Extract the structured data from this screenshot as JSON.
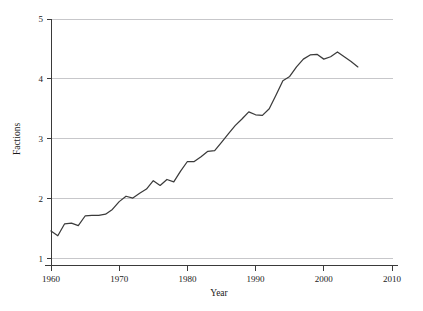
{
  "chart_data": {
    "type": "line",
    "title": "",
    "xlabel": "Year",
    "ylabel": "Factions",
    "xlim": [
      1960,
      2010
    ],
    "ylim": [
      1,
      5
    ],
    "grid": true,
    "legend": null,
    "xticks": [
      1960,
      1970,
      1980,
      1990,
      2000,
      2010
    ],
    "yticks": [
      1,
      2,
      3,
      4,
      5
    ],
    "xtick_labels": [
      "1960",
      "1970",
      "1980",
      "1990",
      "2000",
      "2010"
    ],
    "ytick_labels": [
      "1",
      "2",
      "3",
      "4",
      "5"
    ],
    "line_color": "#3b3b3b",
    "grid_color": "#b9b9bd",
    "series": [
      {
        "name": "Factions",
        "x": [
          1960,
          1961,
          1962,
          1963,
          1964,
          1965,
          1966,
          1967,
          1968,
          1969,
          1970,
          1971,
          1972,
          1973,
          1974,
          1975,
          1976,
          1977,
          1978,
          1979,
          1980,
          1981,
          1982,
          1983,
          1984,
          1985,
          1986,
          1987,
          1988,
          1989,
          1990,
          1991,
          1992,
          1993,
          1994,
          1995,
          1996,
          1997,
          1998,
          1999,
          2000,
          2001,
          2002,
          2003,
          2004,
          2005
        ],
        "values": [
          1.46,
          1.38,
          1.58,
          1.59,
          1.55,
          1.71,
          1.72,
          1.72,
          1.74,
          1.82,
          1.95,
          2.04,
          2.01,
          2.09,
          2.16,
          2.3,
          2.22,
          2.32,
          2.28,
          2.46,
          2.62,
          2.62,
          2.7,
          2.79,
          2.8,
          2.94,
          3.08,
          3.22,
          3.33,
          3.45,
          3.4,
          3.39,
          3.5,
          3.73,
          3.97,
          4.04,
          4.2,
          4.33,
          4.4,
          4.41,
          4.33,
          4.37,
          4.45,
          4.37,
          4.29,
          4.2
        ]
      }
    ]
  },
  "axis_titles": {
    "x": "Year",
    "y": "Factions"
  }
}
